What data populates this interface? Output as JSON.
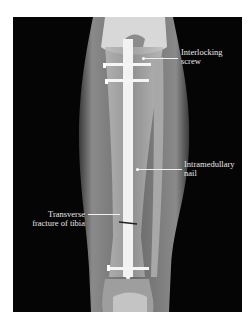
{
  "image": {
    "description": "Anteroposterior X-ray of the lower leg showing an intramedullary nail fixing a tibial fracture",
    "background": "#ffffff",
    "film_color": "#050505"
  },
  "annotations": [
    {
      "id": "interlocking-screw",
      "lines": [
        "Interlocking",
        "screw"
      ]
    },
    {
      "id": "intramedullary-nail",
      "lines": [
        "Intramedullary",
        "nail"
      ]
    },
    {
      "id": "transverse-fracture",
      "lines": [
        "Transverse",
        "fracture of tibia"
      ]
    }
  ]
}
